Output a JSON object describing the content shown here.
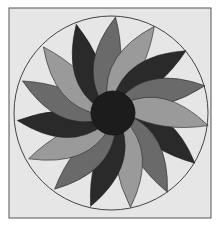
{
  "diagram": {
    "frame": {
      "x": 9,
      "y": 8,
      "w": 202,
      "h": 210,
      "fill": "#e6e6e6",
      "stroke": "#555555"
    },
    "circle": {
      "cx": 111,
      "cy": 113,
      "r": 97,
      "stroke": "#444444",
      "fill": "#e6e6e6"
    },
    "hub": {
      "cx": 113,
      "cy": 113,
      "r": 22,
      "fill": "#1c1c1c"
    },
    "petal_count": 15,
    "petal_colors": [
      "#2a2a2a",
      "#6a6a6a",
      "#9a9a9a"
    ]
  }
}
